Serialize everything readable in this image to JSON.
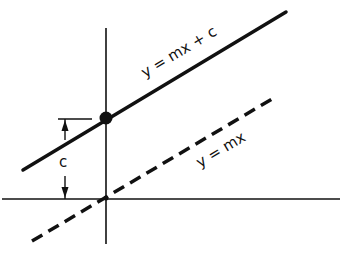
{
  "diagram": {
    "labels": {
      "line_with_intercept": "y = mx + c",
      "line_through_origin": "y = mx",
      "intercept": "c"
    },
    "colors": {
      "ink": "#111111",
      "background": "#ffffff"
    }
  }
}
